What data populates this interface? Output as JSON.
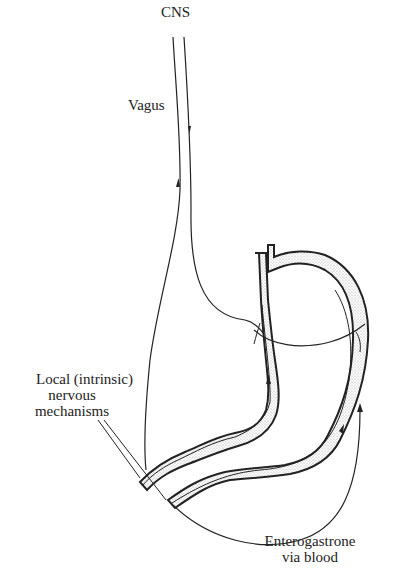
{
  "diagram": {
    "labels": {
      "cns": "CNS",
      "vagus": "Vagus",
      "local_line1": "Local (intrinsic)",
      "local_line2": "nervous",
      "local_line3": "mechanisms",
      "entero_line1": "Enterogastrone",
      "entero_line2": "via blood"
    },
    "colors": {
      "ink": "#222222",
      "stipple": "#bdbdbd",
      "background": "#ffffff"
    }
  }
}
